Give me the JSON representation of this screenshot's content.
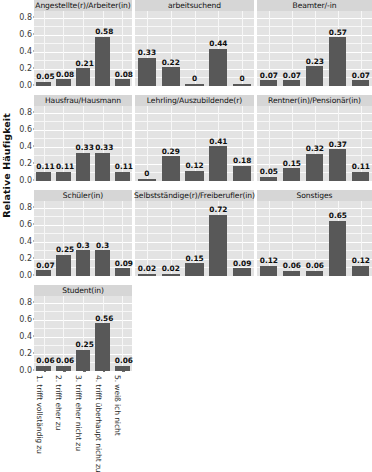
{
  "chart_data": {
    "type": "bar",
    "title": "",
    "xlabel": "",
    "ylabel": "Relative Häufigkeit",
    "ylim": [
      0,
      0.88
    ],
    "grid": true,
    "legend": "none",
    "facet_layout": {
      "rows": 4,
      "cols": 3
    },
    "ytick_labels": [
      "0.0",
      "0.2",
      "0.4",
      "0.6",
      "0.8"
    ],
    "ytick_values": [
      0.0,
      0.2,
      0.4,
      0.6,
      0.8
    ],
    "categories": [
      "1. trifft vollständig zu",
      "2. trifft eher zu",
      "3. trifft eher nicht zu",
      "4. trifft überhaupt nicht zu",
      "5. weiß ich nicht"
    ],
    "panels": [
      {
        "title": "Angestellte(r)/Arbeiter(in)",
        "values": [
          0.05,
          0.08,
          0.21,
          0.58,
          0.08
        ],
        "labels": [
          "0.05",
          "0.08",
          "0.21",
          "0.58",
          "0.08"
        ]
      },
      {
        "title": "arbeitsuchend",
        "values": [
          0.33,
          0.22,
          0.0,
          0.44,
          0.0
        ],
        "labels": [
          "0.33",
          "0.22",
          "0",
          "0.44",
          "0"
        ]
      },
      {
        "title": "Beamter/-in",
        "values": [
          0.07,
          0.07,
          0.23,
          0.57,
          0.07
        ],
        "labels": [
          "0.07",
          "0.07",
          "0.23",
          "0.57",
          "0.07"
        ]
      },
      {
        "title": "Hausfrau/Hausmann",
        "values": [
          0.11,
          0.11,
          0.33,
          0.33,
          0.11
        ],
        "labels": [
          "0.11",
          "0.11",
          "0.33",
          "0.33",
          "0.11"
        ]
      },
      {
        "title": "Lehrling/Auszubildende(r)",
        "values": [
          0.0,
          0.29,
          0.12,
          0.41,
          0.18
        ],
        "labels": [
          "0",
          "0.29",
          "0.12",
          "0.41",
          "0.18"
        ]
      },
      {
        "title": "Rentner(in)/Pensionär(in)",
        "values": [
          0.05,
          0.15,
          0.32,
          0.37,
          0.11
        ],
        "labels": [
          "0.05",
          "0.15",
          "0.32",
          "0.37",
          "0.11"
        ]
      },
      {
        "title": "Schüler(in)",
        "values": [
          0.07,
          0.25,
          0.3,
          0.3,
          0.09
        ],
        "labels": [
          "0.07",
          "0.25",
          "0.3",
          "0.3",
          "0.09"
        ]
      },
      {
        "title": "Selbstständige(r)/Freiberufler(in)",
        "values": [
          0.02,
          0.02,
          0.15,
          0.72,
          0.09
        ],
        "labels": [
          "0.02",
          "0.02",
          "0.15",
          "0.72",
          "0.09"
        ]
      },
      {
        "title": "Sonstiges",
        "values": [
          0.12,
          0.06,
          0.06,
          0.65,
          0.12
        ],
        "labels": [
          "0.12",
          "0.06",
          "0.06",
          "0.65",
          "0.12"
        ]
      },
      {
        "title": "Student(in)",
        "values": [
          0.06,
          0.06,
          0.25,
          0.56,
          0.06
        ],
        "labels": [
          "0.06",
          "0.06",
          "0.25",
          "0.56",
          "0.06"
        ]
      }
    ],
    "colors": {
      "bar": "#585858",
      "panel_background": "#e3e3e3",
      "strip_background": "#d6d6d6",
      "gridline_major": "#ffffff",
      "gridline_minor": "#f7f7f7",
      "text": "#111111"
    }
  }
}
